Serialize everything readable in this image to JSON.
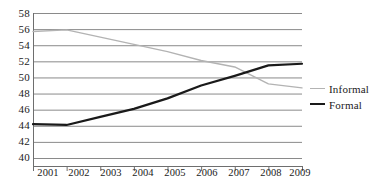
{
  "chart_data": {
    "type": "line",
    "title": "",
    "subtitle": "",
    "xlabel": "",
    "ylabel": "",
    "x": [
      2001,
      2002,
      2003,
      2004,
      2005,
      2006,
      2007,
      2008,
      2009
    ],
    "xtick_labels": [
      "2001",
      "2002",
      "2003",
      "2004",
      "2005",
      "2006",
      "2007",
      "2008",
      "2009"
    ],
    "ytick_labels": [
      "58",
      "56",
      "54",
      "52",
      "50",
      "48",
      "46",
      "44",
      "42",
      "40"
    ],
    "ytick_values": [
      58,
      56,
      54,
      52,
      50,
      48,
      46,
      44,
      42,
      40
    ],
    "ylim": [
      40,
      58
    ],
    "xlim": [
      2001,
      2009
    ],
    "grid": "horizontal",
    "legend_position": "right",
    "series": [
      {
        "name": "Informal",
        "color": "#b3b3b3",
        "values": [
          55.7,
          55.9,
          55.0,
          54.1,
          53.2,
          52.1,
          51.3,
          49.2,
          48.7
        ]
      },
      {
        "name": "Formal",
        "color": "#1a1a1a",
        "values": [
          44.2,
          44.1,
          45.1,
          46.1,
          47.4,
          49.0,
          50.2,
          51.5,
          51.7
        ]
      }
    ]
  },
  "legend": {
    "items": [
      {
        "label": "Informal"
      },
      {
        "label": "Formal"
      }
    ]
  }
}
